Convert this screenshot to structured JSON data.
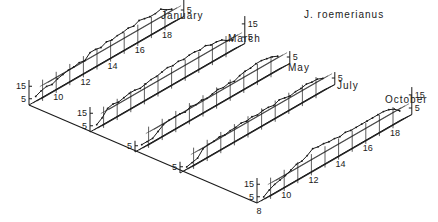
{
  "chart_data": {
    "type": "line",
    "style": "3d-stacked-waterfall",
    "title": "J. roemerianus",
    "xlabel": "",
    "ylabel": "",
    "x_ticks": [
      8,
      10,
      12,
      14,
      16,
      18
    ],
    "x_range": [
      8,
      18.5
    ],
    "y_ticks": [
      5,
      15
    ],
    "y_range": [
      0,
      20
    ],
    "grid": true,
    "legend": null,
    "panels": [
      {
        "name": "January",
        "y_ticks_shown": [
          5,
          15
        ],
        "x_ticks_shown": [
          10,
          12,
          14,
          16,
          18
        ],
        "x": [
          8.2,
          8.6,
          9.0,
          9.4,
          9.8,
          10.2,
          10.6,
          11.0,
          11.4,
          11.8,
          12.2,
          12.6,
          13.0,
          13.4,
          13.8,
          14.2,
          14.6,
          15.0,
          15.4,
          15.8,
          16.2,
          16.6,
          17.0,
          17.4,
          17.8,
          18.2
        ],
        "values": [
          4,
          6,
          7,
          6,
          8,
          9,
          10,
          10,
          11,
          10,
          14,
          14,
          13,
          15,
          14,
          15,
          15,
          16,
          15,
          17,
          16,
          15,
          15,
          16,
          13,
          11
        ]
      },
      {
        "name": "March",
        "y_ticks_shown": [
          5,
          15
        ],
        "x_ticks_shown": [],
        "x": [
          8.2,
          8.6,
          9.0,
          9.4,
          9.8,
          10.2,
          10.6,
          11.0,
          11.4,
          11.8,
          12.2,
          12.6,
          13.0,
          13.4,
          13.8,
          14.2,
          14.6,
          15.0,
          15.4,
          15.8,
          16.2,
          16.6,
          17.0,
          17.4,
          17.8,
          18.2
        ],
        "values": [
          3,
          6,
          11,
          12,
          11,
          12,
          13,
          13,
          12,
          13,
          14,
          14,
          15,
          16,
          15,
          16,
          15,
          16,
          16,
          15,
          16,
          14,
          14,
          13,
          10,
          8
        ]
      },
      {
        "name": "May",
        "y_ticks_shown": [
          5
        ],
        "x_ticks_shown": [],
        "x": [
          8.2,
          8.6,
          9.0,
          9.4,
          9.8,
          10.2,
          10.6,
          11.0,
          11.4,
          11.8,
          12.2,
          12.6,
          13.0,
          13.4,
          13.8,
          14.2,
          14.6,
          15.0,
          15.4,
          15.8,
          16.2,
          16.6,
          17.0,
          17.4,
          17.8,
          18.2
        ],
        "values": [
          3,
          3,
          3,
          6,
          9,
          10,
          10,
          10,
          9,
          11,
          10,
          11,
          10,
          11,
          12,
          11,
          12,
          11,
          13,
          14,
          14,
          15,
          15,
          14,
          13,
          11
        ]
      },
      {
        "name": "July",
        "y_ticks_shown": [
          5
        ],
        "x_ticks_shown": [],
        "x": [
          8.2,
          8.6,
          9.0,
          9.4,
          9.8,
          10.2,
          10.6,
          11.0,
          11.4,
          11.8,
          12.2,
          12.6,
          13.0,
          13.4,
          13.8,
          14.2,
          14.6,
          15.0,
          15.4,
          15.8,
          16.2,
          16.6,
          17.0,
          17.4,
          17.8,
          18.2
        ],
        "values": [
          2,
          3,
          4,
          9,
          10,
          10,
          11,
          10,
          11,
          11,
          12,
          11,
          12,
          11,
          12,
          12,
          11,
          13,
          12,
          11,
          12,
          12,
          13,
          12,
          12,
          10
        ]
      },
      {
        "name": "October",
        "y_ticks_shown": [
          5,
          15
        ],
        "x_ticks_shown": [
          8,
          10,
          12,
          14,
          16,
          18
        ],
        "x": [
          8.2,
          8.6,
          9.0,
          9.4,
          9.8,
          10.2,
          10.6,
          11.0,
          11.4,
          11.8,
          12.2,
          12.6,
          13.0,
          13.4,
          13.8,
          14.2,
          14.6,
          15.0,
          15.4,
          15.8,
          16.2,
          16.6,
          17.0,
          17.4,
          17.8,
          18.2
        ],
        "values": [
          2,
          5,
          7,
          8,
          9,
          11,
          13,
          13,
          15,
          18,
          17,
          17,
          16,
          16,
          15,
          16,
          15,
          15,
          15,
          15,
          15,
          15,
          15,
          14,
          12,
          8
        ]
      }
    ]
  },
  "labels": {
    "title": "J. roemerianus",
    "panels": [
      "January",
      "March",
      "May",
      "July",
      "October"
    ]
  }
}
